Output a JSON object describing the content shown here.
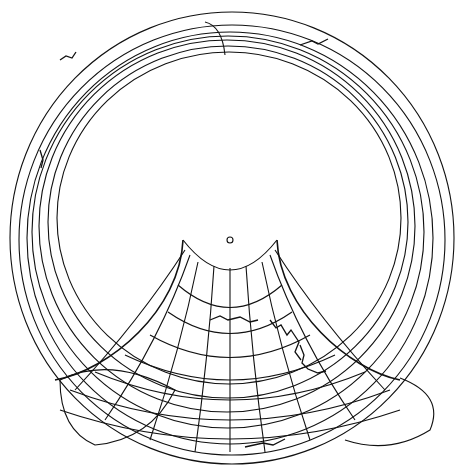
{
  "map": {
    "type": "polar projection line drawing",
    "center_marker": "small-circle",
    "colors": {
      "line": "#111111",
      "background": "#ffffff"
    }
  }
}
